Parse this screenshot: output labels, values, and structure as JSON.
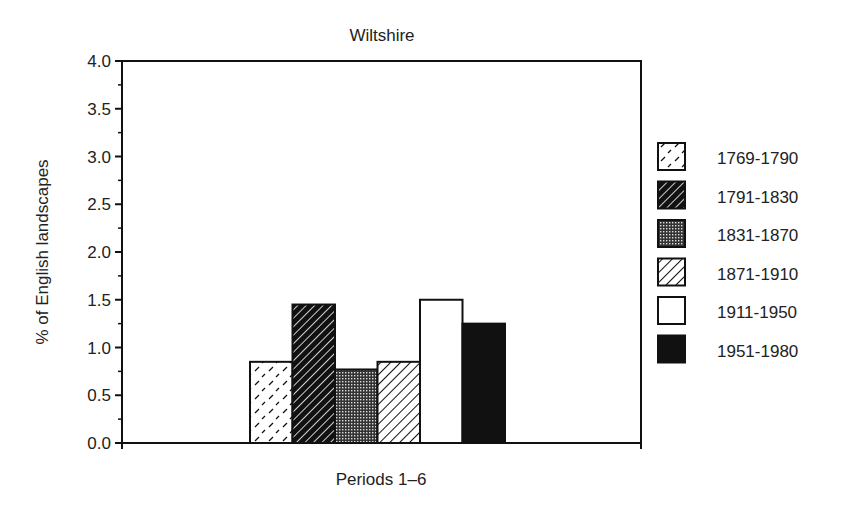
{
  "chart_data": {
    "type": "bar",
    "title": "Wiltshire",
    "xlabel": "Periods 1–6",
    "ylabel": "% of English landscapes",
    "ylim": [
      0,
      4.0
    ],
    "yticks": [
      "0.0",
      "0.5",
      "1.0",
      "1.5",
      "2.0",
      "2.5",
      "3.0",
      "3.5",
      "4.0"
    ],
    "grid": false,
    "legend_position": "right",
    "categories": [
      "1769-1790",
      "1791-1830",
      "1831-1870",
      "1871-1910",
      "1911-1950",
      "1951-1980"
    ],
    "values": [
      0.85,
      1.45,
      0.77,
      0.85,
      1.5,
      1.25
    ],
    "patterns": [
      "dashes",
      "dark-hatch",
      "crosshatch",
      "light-hatch",
      "white",
      "black"
    ]
  }
}
